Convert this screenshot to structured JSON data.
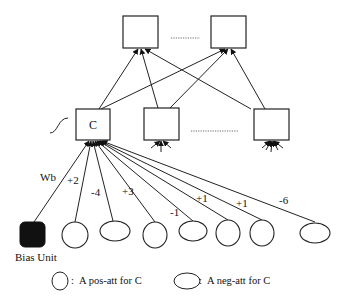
{
  "diagram": {
    "type": "neural-network",
    "top_layer": {
      "nodes": [
        {
          "id": "top-1",
          "x": 123,
          "y": 16,
          "w": 35,
          "h": 32
        },
        {
          "id": "top-2",
          "x": 211,
          "y": 16,
          "w": 35,
          "h": 32
        }
      ],
      "ellipsis": "..........."
    },
    "hidden_layer": {
      "nodes": [
        {
          "id": "C",
          "label": "C",
          "x": 76,
          "y": 109,
          "w": 34,
          "h": 31
        },
        {
          "id": "hidden-2",
          "label": "",
          "x": 144,
          "y": 108,
          "w": 35,
          "h": 32
        },
        {
          "id": "hidden-3",
          "label": "",
          "x": 254,
          "y": 109,
          "w": 35,
          "h": 31
        }
      ],
      "ellipsis": "..............",
      "activation_symbol": "sigmoid"
    },
    "input_layer": {
      "bias": {
        "label": "Bias Unit",
        "weight_label": "Wb"
      },
      "nodes": [
        {
          "kind": "pos-att",
          "weight": "+2"
        },
        {
          "kind": "neg-att",
          "weight": "-4"
        },
        {
          "kind": "pos-att",
          "weight": "+3"
        },
        {
          "kind": "neg-att",
          "weight": "-1"
        },
        {
          "kind": "pos-att",
          "weight": "+1"
        },
        {
          "kind": "pos-att",
          "weight": "+1"
        },
        {
          "kind": "neg-att",
          "weight": "-6"
        }
      ]
    },
    "legend": {
      "pos": "A pos-att for C",
      "neg": "A neg-att for C",
      "separator": ":"
    }
  }
}
